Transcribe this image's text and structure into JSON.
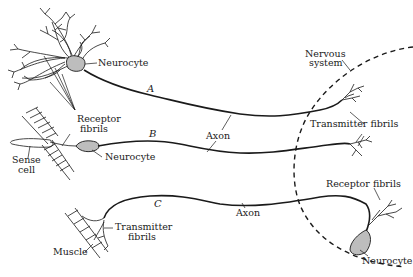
{
  "diagram": {
    "type": "neuron-pathways",
    "labels": {
      "neurocyte_a": "Neurocyte",
      "letter_a": "A",
      "nervous_system": "Nervous\nsystem",
      "nervous_line1": "Nervous",
      "nervous_line2": "system",
      "receptor_fibrils_b_line1": "Receptor",
      "receptor_fibrils_b_line2": "fibrils",
      "letter_b": "B",
      "axon_ab": "Axon",
      "transmitter_fibrils_ab": "Transmitter fibrils",
      "sense_cell_line1": "Sense",
      "sense_cell_line2": "cell",
      "neurocyte_b": "Neurocyte",
      "letter_c": "C",
      "receptor_fibrils_c": "Receptor fibrils",
      "transmitter_fibrils_c_line1": "Transmitter",
      "transmitter_fibrils_c_line2": "fibrils",
      "axon_c": "Axon",
      "muscle": "Muscle",
      "neurocyte_c": "Neurocyte"
    },
    "pathways": [
      {
        "id": "A",
        "description": "Neurocyte with dendrites; axon enters nervous system ending in transmitter fibrils"
      },
      {
        "id": "B",
        "description": "Sense cell with receptor fibrils; neurocyte; axon enters nervous system ending in transmitter fibrils"
      },
      {
        "id": "C",
        "description": "Neurocyte inside nervous system with receptor fibrils; axon exits to muscle via transmitter fibrils"
      }
    ],
    "colors": {
      "ink": "#1a1a1a",
      "cell_fill": "#bdbdbd",
      "background": "#ffffff"
    }
  }
}
